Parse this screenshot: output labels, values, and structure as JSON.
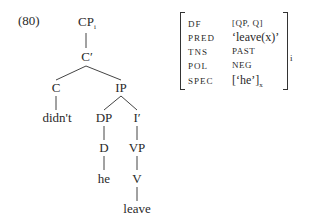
{
  "example": {
    "number": "(80)"
  },
  "tree": {
    "nodes": {
      "cp": "CP",
      "cp_sub": "i",
      "cbar": "C′",
      "c": "C",
      "ip": "IP",
      "didnt": "didn't",
      "dp": "DP",
      "ibar": "I′",
      "d": "D",
      "vp": "VP",
      "he": "he",
      "v": "V",
      "leave": "leave"
    }
  },
  "fstructure": {
    "rows": [
      {
        "attr": "DF",
        "value": "[QP, Q]"
      },
      {
        "attr": "PRED",
        "value": "‘leave(x)’"
      },
      {
        "attr": "TNS",
        "value": "PAST"
      },
      {
        "attr": "POL",
        "value": "NEG"
      },
      {
        "attr": "SPEC",
        "value": "[‘he’]",
        "sub": "x"
      }
    ],
    "index": "i"
  }
}
